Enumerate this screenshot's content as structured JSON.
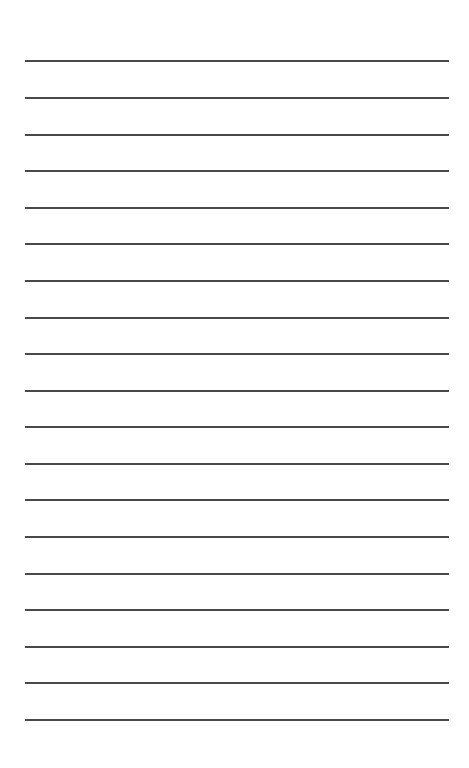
{
  "page": {
    "type": "lined-paper",
    "background_color": "#ffffff",
    "line_color": "#3a3a3a",
    "line_count": 19,
    "line_left_px": 25,
    "line_right_px": 449,
    "line_positions_y": [
      60,
      97,
      134,
      170,
      207,
      243,
      280,
      317,
      353,
      390,
      426,
      463,
      499,
      536,
      573,
      609,
      646,
      682,
      719
    ]
  }
}
